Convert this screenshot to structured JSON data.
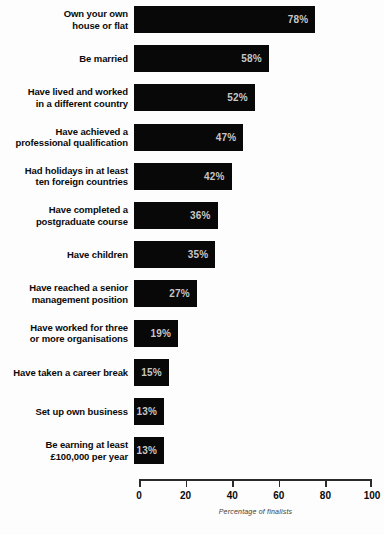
{
  "chart_data": {
    "type": "bar",
    "orientation": "horizontal",
    "title": "",
    "xlabel": "Percentage of finalists",
    "ylabel": "",
    "xlim": [
      0,
      100
    ],
    "xticks": [
      "0",
      "20",
      "40",
      "60",
      "80",
      "100"
    ],
    "grid": false,
    "legend": null,
    "value_suffix": "%",
    "categories": [
      "Own your own\nhouse or flat",
      "Be married",
      "Have lived and worked\nin a different country",
      "Have achieved a\nprofessional qualification",
      "Had holidays in at least\nten foreign countries",
      "Have completed a\npostgraduate course",
      "Have children",
      "Have reached a senior\nmanagement position",
      "Have worked for three\nor more organisations",
      "Have taken a career break",
      "Set up own business",
      "Be earning at least\n£100,000 per year"
    ],
    "values": [
      78,
      58,
      52,
      47,
      42,
      36,
      35,
      27,
      19,
      15,
      13,
      13
    ],
    "value_labels": [
      "78%",
      "58%",
      "52%",
      "47%",
      "42%",
      "36%",
      "35%",
      "27%",
      "19%",
      "15%",
      "13%",
      "13%"
    ],
    "colors": {
      "bar": "#080808",
      "value_text": "#c6c6c6",
      "label_text": "#0a0a0a",
      "axis": "#2b2b2b",
      "background": "#fdfdfd"
    }
  }
}
